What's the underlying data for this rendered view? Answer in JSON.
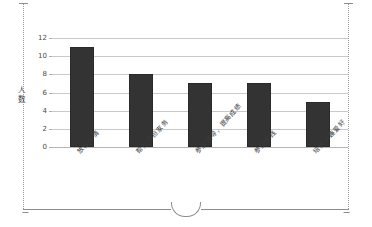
{
  "frame": {
    "style": "dotted-sheet-edge",
    "notch": "semicircle-notch"
  },
  "chart_data": {
    "type": "bar",
    "title": "",
    "xlabel": "",
    "ylabel": "人数",
    "ylim": [
      0,
      12
    ],
    "ytick_step": 2,
    "yticks": [
      "0",
      "2",
      "4",
      "6",
      "8",
      "10",
      "12"
    ],
    "grid": true,
    "legend": false,
    "bar_color": "#333333",
    "categories": [
      "放松心情",
      "帮忙分担家务",
      "参加辅导，提高成绩",
      "参加实践",
      "培养兴趣爱好"
    ],
    "values": [
      11,
      8,
      7,
      7,
      5
    ]
  }
}
